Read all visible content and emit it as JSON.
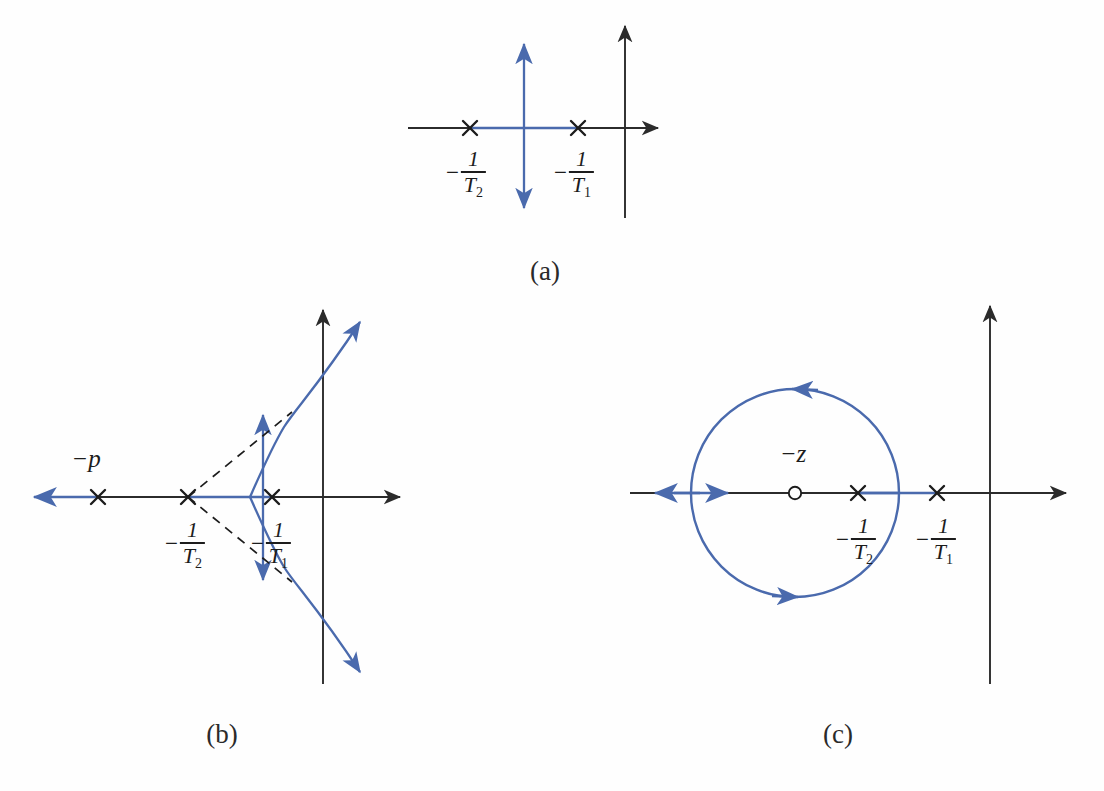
{
  "figure": {
    "title": "",
    "kind": "root-locus-diagrams",
    "colors": {
      "locus_blue": "#4a6aad",
      "axis_black": "#2b2b2b",
      "label_black": "#1c1c1c",
      "background": "#fefefe"
    },
    "captions": [
      {
        "id": "a",
        "text": "(a)",
        "x": 545,
        "y": 258
      },
      {
        "id": "b",
        "text": "(b)",
        "x": 222,
        "y": 722
      },
      {
        "id": "c",
        "text": "(c)",
        "x": 838,
        "y": 722
      }
    ]
  },
  "labels": {
    "minus": "−",
    "one": "1",
    "T": "T",
    "sub1": "1",
    "sub2": "2",
    "minus_p": "−p",
    "minus_z": "−z"
  },
  "panels": [
    {
      "id": "a",
      "name": "panel-a-root-locus",
      "axis": {
        "real_y": 128,
        "imag_x": 625
      },
      "poles": [
        {
          "name": "pole-minus-one-over-T2",
          "x": 470,
          "label": "-1/T2",
          "label_x": 466,
          "label_y": 148
        },
        {
          "name": "pole-minus-one-over-T1",
          "x": 578,
          "label": "-1/T1",
          "label_x": 574,
          "label_y": 148
        }
      ],
      "zeros": [],
      "locus": {
        "type": "vertical-line-plus-segment",
        "breakaway_x": 524,
        "vertical_top_y": 40,
        "vertical_bottom_y": 212,
        "segment_from_x": 470,
        "segment_to_x": 578
      }
    },
    {
      "id": "b",
      "name": "panel-b-root-locus",
      "axis": {
        "real_y": 497,
        "imag_x": 323
      },
      "poles": [
        {
          "name": "pole-minus-p",
          "x": 98,
          "label": "-p",
          "label_x": 86,
          "label_y": 452
        },
        {
          "name": "pole-minus-one-over-T2",
          "x": 188,
          "label": "-1/T2",
          "label_x": 185,
          "label_y": 519
        },
        {
          "name": "pole-minus-one-over-T1",
          "x": 272,
          "label": "-1/T1",
          "label_x": 271,
          "label_y": 519
        }
      ],
      "zeros": [],
      "locus": {
        "type": "three-branch-with-asymptotes",
        "breakaway_x": 188,
        "asymptote_angle_deg": 60,
        "vertical_top_y": 410,
        "vertical_bottom_y": 586,
        "left_branch_arrow_x": 30
      }
    },
    {
      "id": "c",
      "name": "panel-c-root-locus",
      "axis": {
        "real_y": 493,
        "imag_x": 990
      },
      "poles": [
        {
          "name": "pole-minus-one-over-T2",
          "x": 858,
          "label": "-1/T2",
          "label_x": 856,
          "label_y": 515
        },
        {
          "name": "pole-minus-one-over-T1",
          "x": 937,
          "label": "-1/T1",
          "label_x": 936,
          "label_y": 515
        }
      ],
      "zeros": [
        {
          "name": "zero-minus-z",
          "x": 795,
          "label": "-z",
          "label_x": 793,
          "label_y": 447
        }
      ],
      "locus": {
        "type": "circle-plus-real-axis",
        "circle_center_x": 795,
        "circle_center_y": 493,
        "circle_radius": 104,
        "direction": "counterclockwise",
        "real_segment_from_x": 937,
        "real_segment_to_x": 628
      }
    }
  ]
}
